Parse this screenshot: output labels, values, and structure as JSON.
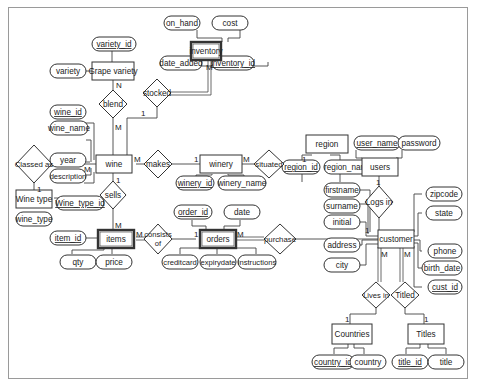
{
  "diagram": {
    "type": "entity-relationship",
    "entities": [
      {
        "id": "inventory",
        "label": "inventory",
        "weak": true
      },
      {
        "id": "grape_variety",
        "label": "Grape variety",
        "weak": false
      },
      {
        "id": "wine",
        "label": "wine",
        "weak": false
      },
      {
        "id": "winery",
        "label": "winery",
        "weak": false
      },
      {
        "id": "region",
        "label": "region",
        "weak": false
      },
      {
        "id": "users",
        "label": "users",
        "weak": false
      },
      {
        "id": "wine_type",
        "label": "Wine type",
        "weak": false
      },
      {
        "id": "items",
        "label": "items",
        "weak": true
      },
      {
        "id": "orders",
        "label": "orders",
        "weak": true
      },
      {
        "id": "customer",
        "label": "customer",
        "weak": false
      },
      {
        "id": "countries",
        "label": "Countries",
        "weak": false
      },
      {
        "id": "titles",
        "label": "Titles",
        "weak": false
      }
    ],
    "relationships": [
      {
        "id": "blend",
        "label": "blend"
      },
      {
        "id": "stocked",
        "label": "stocked"
      },
      {
        "id": "classed_as",
        "label": "Classed as"
      },
      {
        "id": "makes",
        "label": "makes"
      },
      {
        "id": "situated",
        "label": "situated"
      },
      {
        "id": "sells",
        "label": "sells"
      },
      {
        "id": "logs_in",
        "label": "Logs in"
      },
      {
        "id": "consists_of",
        "label": "consists of",
        "line1": "consists",
        "line2": "of"
      },
      {
        "id": "purchase",
        "label": "purchase"
      },
      {
        "id": "lives_in",
        "label": "Lives in"
      },
      {
        "id": "titled",
        "label": "Titled"
      }
    ],
    "attributes": {
      "on_hand": {
        "label": "on_hand",
        "key": false
      },
      "cost": {
        "label": "cost",
        "key": false
      },
      "date_added": {
        "label": "date_added",
        "key": false
      },
      "inventory_id": {
        "label": "inventory_id",
        "key": true
      },
      "variety_id": {
        "label": "variety_id",
        "key": true
      },
      "variety": {
        "label": "variety",
        "key": false
      },
      "wine_id": {
        "label": "wine_id",
        "key": true
      },
      "wine_name": {
        "label": "wine_name",
        "key": false
      },
      "year": {
        "label": "year",
        "key": false
      },
      "description": {
        "label": "description",
        "key": false
      },
      "winery_id": {
        "label": "winery_id",
        "key": true
      },
      "winery_name": {
        "label": "winery_name",
        "key": false
      },
      "region_id": {
        "label": "region_id",
        "key": true
      },
      "region_name": {
        "label": "region_name",
        "key": false
      },
      "user_name": {
        "label": "user_name",
        "key": true
      },
      "password": {
        "label": "password",
        "key": false
      },
      "wine_type_id": {
        "label": "Wine_type_id",
        "key": true
      },
      "wine_type": {
        "label": "wine_type",
        "key": false
      },
      "item_id": {
        "label": "item_id",
        "key": true
      },
      "qty": {
        "label": "qty",
        "key": false
      },
      "price": {
        "label": "price",
        "key": false
      },
      "order_id": {
        "label": "order_id",
        "key": true
      },
      "date": {
        "label": "date",
        "key": false
      },
      "creditcard": {
        "label": "creditcard",
        "key": false
      },
      "expirydate": {
        "label": "expirydate",
        "key": false
      },
      "instructions": {
        "label": "instructions",
        "key": false
      },
      "firstname": {
        "label": "firstname",
        "key": false
      },
      "surname": {
        "label": "surname",
        "key": false
      },
      "initial": {
        "label": "initial",
        "key": false
      },
      "address": {
        "label": "address",
        "key": false
      },
      "city": {
        "label": "city",
        "key": false
      },
      "zipcode": {
        "label": "zipcode",
        "key": false
      },
      "state": {
        "label": "state",
        "key": false
      },
      "phone": {
        "label": "phone",
        "key": false
      },
      "birth_date": {
        "label": "birth_date",
        "key": false
      },
      "cust_id": {
        "label": "cust_id",
        "key": true
      },
      "country_id": {
        "label": "country_id",
        "key": true
      },
      "country": {
        "label": "country",
        "key": false
      },
      "title_id": {
        "label": "title_id",
        "key": true
      },
      "title": {
        "label": "title",
        "key": false
      }
    },
    "cardinalities": {
      "inventory_stocked": "M",
      "grape_blend": "N",
      "wine_blend": "M",
      "wine_stocked": "1",
      "wine_classed": "M",
      "winetype_classed": "1",
      "wine_makes": "M",
      "winery_makes": "1",
      "winery_situated": "M",
      "region_situated": "1",
      "wine_sells": "1",
      "items_sells": "M",
      "items_consists": "M",
      "orders_consists": "1",
      "orders_purchase": "M",
      "customer_purchase": "1",
      "users_logs": "1",
      "customer_lives": "M",
      "customer_titled": "M",
      "countries_lives": "1",
      "titles_titled": "1"
    }
  }
}
